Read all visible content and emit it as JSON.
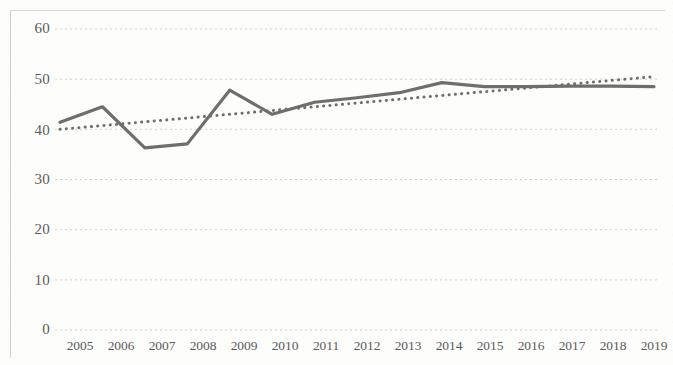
{
  "chart_data": {
    "type": "line",
    "title": "",
    "subtitle": "",
    "xlabel": "",
    "ylabel": "",
    "categories": [
      "2005",
      "2006",
      "2007",
      "2008",
      "2009",
      "2010",
      "2011",
      "2012",
      "2013",
      "2014",
      "2015",
      "2016",
      "2017",
      "2018",
      "2019"
    ],
    "x_tick_labels": [
      "2005",
      "2006",
      "2007",
      "2008",
      "2009",
      "2010",
      "2011",
      "2012",
      "2013",
      "2014",
      "2015",
      "2016",
      "2017",
      "2018",
      "2019"
    ],
    "y_tick_labels": [
      "0",
      "10",
      "20",
      "30",
      "40",
      "50",
      "60"
    ],
    "y_ticks": [
      0,
      10,
      20,
      30,
      40,
      50,
      60
    ],
    "ylim": [
      0,
      60
    ],
    "xlim": [
      "2005",
      "2019"
    ],
    "grid": "horizontal-dotted",
    "legend": "none",
    "series": [
      {
        "name": "data-series",
        "style": "solid",
        "color": "#6e6e6e",
        "width": 3.2,
        "values": [
          41.4,
          44.5,
          36.3,
          37.1,
          47.8,
          43.0,
          45.4,
          46.3,
          47.3,
          49.3,
          48.5,
          48.5,
          48.6,
          48.6,
          48.5
        ]
      },
      {
        "name": "linear-trendline",
        "style": "dotted",
        "color": "#6e6e6e",
        "width": 3.0,
        "values": [
          40.0,
          40.75,
          41.5,
          42.25,
          43.0,
          43.75,
          44.5,
          45.25,
          46.0,
          46.75,
          47.5,
          48.25,
          49.0,
          49.75,
          50.5
        ]
      }
    ],
    "annotations": []
  }
}
